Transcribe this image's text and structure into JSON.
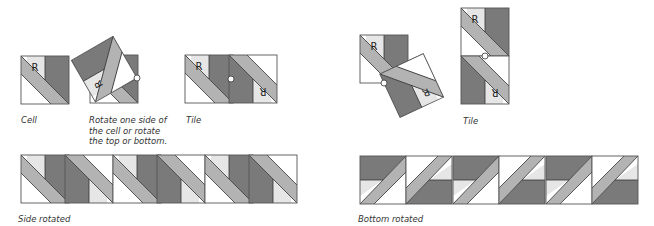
{
  "colors": {
    "dark": "#7a7a7a",
    "medium": "#b3b3b3",
    "light": "#e6e6e6",
    "white": "#ffffff",
    "stroke": "#333333"
  },
  "cell_letter": "R",
  "captions": {
    "cell": "Cell",
    "rotate_line1": "Rotate one side of",
    "rotate_line2": "the cell or rotate",
    "rotate_line3": "the top or bottom.",
    "tile_left": "Tile",
    "tile_right": "Tile",
    "side_rotated": "Side rotated",
    "bottom_rotated": "Bottom rotated"
  }
}
